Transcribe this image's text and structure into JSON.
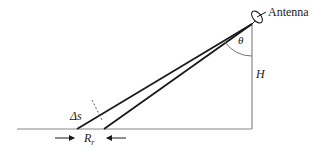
{
  "diagram": {
    "labels": {
      "antenna": "Antenna",
      "theta": "θ",
      "height": "H",
      "delta_s": "Δs",
      "range_main": "R",
      "range_sub": "r"
    },
    "colors": {
      "line": "#1a1a1a",
      "ground": "#888888",
      "text": "#222222"
    }
  }
}
